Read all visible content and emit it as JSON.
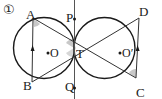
{
  "figure": {
    "number_label": "①",
    "points": {
      "A": "A",
      "B": "B",
      "C": "C",
      "D": "D",
      "P": "P",
      "Q": "Q",
      "T": "T",
      "O": "O",
      "O_prime": "O′"
    },
    "colors": {
      "stroke": "#1a1a1a",
      "angle_fill": "#c8c8c8"
    }
  }
}
